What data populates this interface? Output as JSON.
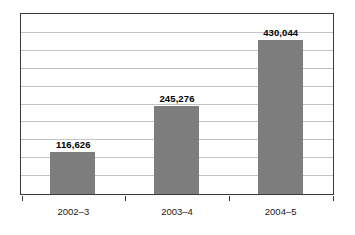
{
  "chart_data": {
    "type": "bar",
    "title": "",
    "subtitle": "",
    "xlabel": "",
    "ylabel": "",
    "categories": [
      "2002–3",
      "2003–4",
      "2004–5"
    ],
    "values": [
      116626,
      245276,
      430044
    ],
    "data_labels": [
      "116,626",
      "245,276",
      "430,044"
    ],
    "ylim": [
      0,
      500000
    ],
    "gridlines": 9,
    "grid": true,
    "legend": "none",
    "series": [
      {
        "name": "",
        "values": [
          116626,
          245276,
          430044
        ]
      }
    ],
    "colors": {
      "bar_fill": "#7d7d7d",
      "frame": "#3a3a3a",
      "gridline": "#c4c4c4",
      "label_text": "#000000",
      "category_text": "#1a1a1a",
      "background": "#ffffff"
    }
  }
}
